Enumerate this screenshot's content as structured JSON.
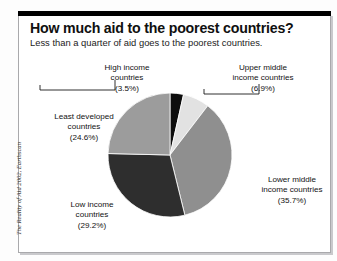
{
  "header": {
    "title": "How much aid to the poorest countries?",
    "subtitle": "Less than a quarter of aid goes to the poorest countries."
  },
  "credit": "The Reality of Aid 2002, Earthscan",
  "chart_data": {
    "type": "pie",
    "title": "How much aid to the poorest countries?",
    "subtitle": "Less than a quarter of aid goes to the poorest countries.",
    "xlabel": "",
    "ylabel": "",
    "legend_position": "callout-labels",
    "grid": false,
    "units": "percent of aid",
    "total": 99.9,
    "start_angle_deg": 0,
    "direction": "clockwise",
    "categories": [
      "High income countries",
      "Upper middle income countries",
      "Lower middle income countries",
      "Low income countries",
      "Least developed countries"
    ],
    "values": [
      3.5,
      6.9,
      35.7,
      29.2,
      24.6
    ],
    "labels": [
      "(3.5%)",
      "(6.9%)",
      "(35.7%)",
      "(29.2%)",
      "(24.6%)"
    ],
    "colors": [
      "#0d0d0d",
      "#e2e2e2",
      "#8f8f8f",
      "#2e2e2e",
      "#9c9c9c"
    ],
    "slices": [
      {
        "name": "High income countries",
        "name_line1": "High income",
        "name_line2": "countries",
        "value": 3.5,
        "label": "(3.5%)",
        "color": "#0d0d0d",
        "callout": true
      },
      {
        "name": "Upper middle income countries",
        "name_line1": "Upper middle",
        "name_line2": "income countries",
        "value": 6.9,
        "label": "(6.9%)",
        "color": "#e2e2e2",
        "callout": true
      },
      {
        "name": "Lower middle income countries",
        "name_line1": "Lower middle",
        "name_line2": "income countries",
        "value": 35.7,
        "label": "(35.7%)",
        "color": "#8f8f8f",
        "callout": false
      },
      {
        "name": "Low income countries",
        "name_line1": "Low income",
        "name_line2": "countries",
        "value": 29.2,
        "label": "(29.2%)",
        "color": "#2e2e2e",
        "callout": false
      },
      {
        "name": "Least developed countries",
        "name_line1": "Least developed",
        "name_line2": "countries",
        "value": 24.6,
        "label": "(24.6%)",
        "color": "#9c9c9c",
        "callout": false
      }
    ]
  }
}
